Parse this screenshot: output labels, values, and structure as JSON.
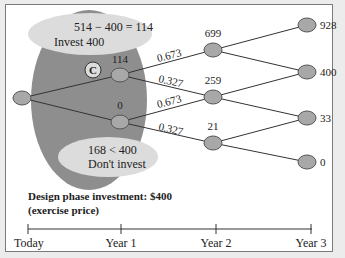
{
  "diagram": {
    "top_label": {
      "line1": "514 − 400 = 114",
      "line2": "Invest 400"
    },
    "bottom_label": {
      "line1": "168 < 400",
      "line2": "Don't invest"
    },
    "marker": "C",
    "nodes": {
      "year1_up": "114",
      "year1_down": "0",
      "year2_up": "699",
      "year2_mid": "259",
      "year2_down": "21",
      "year3_a": "928",
      "year3_b": "400",
      "year3_c": "33",
      "year3_d": "0"
    },
    "probabilities": {
      "up1": "0.673",
      "down1": "0.327",
      "up2": "0.673",
      "down2": "0.327"
    },
    "caption": {
      "line1": "Design phase investment: $400",
      "line2": "(exercise price)"
    },
    "timeline": [
      "Today",
      "Year 1",
      "Year 2",
      "Year 3"
    ],
    "colors": {
      "node_fill": "#a8a8a8",
      "shaded_region": "#8e8e8e",
      "label_bubble": "#dcdcdc"
    }
  }
}
